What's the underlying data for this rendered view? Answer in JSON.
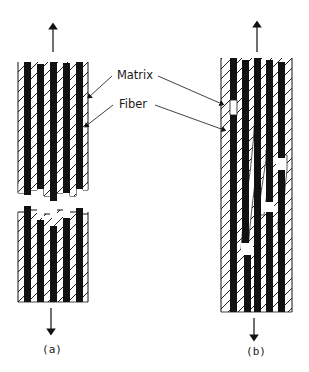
{
  "figure": {
    "type": "schematic",
    "labels": {
      "matrix": "Matrix",
      "fiber": "Fiber"
    },
    "panels": [
      {
        "id": "a",
        "caption": "(a)",
        "description": "Planar (flat) fracture: fibers and matrix break in a single plane"
      },
      {
        "id": "b",
        "caption": "(b)",
        "description": "Fiber pull-out: fibers break at different positions, staggered fracture"
      }
    ],
    "load_arrows": [
      "up",
      "down"
    ],
    "colors": {
      "fiber": "#111111",
      "matrix_hatch": "#222222",
      "background": "#ffffff"
    }
  }
}
